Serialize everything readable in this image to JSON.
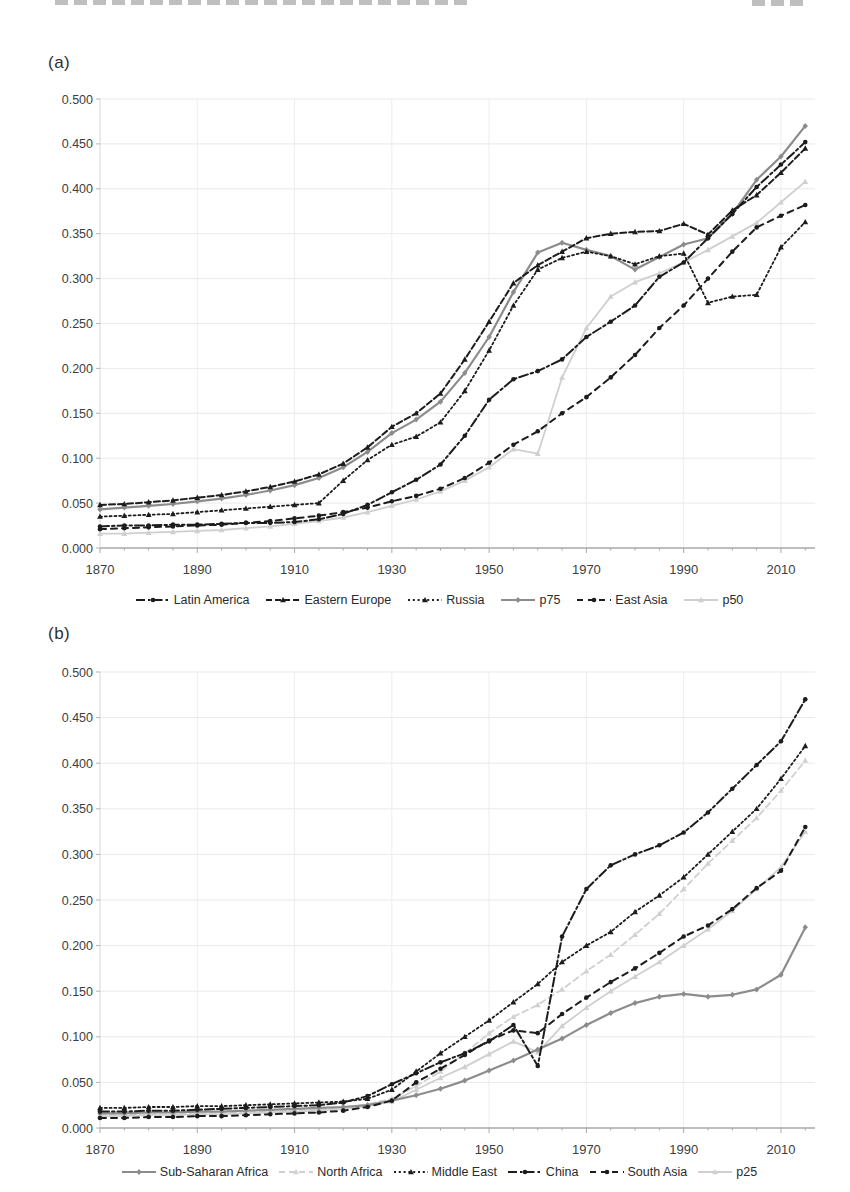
{
  "page": {
    "background": "#ffffff",
    "text_color": "#3d3d3d"
  },
  "chart_data": [
    {
      "id": "a",
      "type": "line",
      "panel_label": "(a)",
      "title": "",
      "xlabel": "",
      "ylabel": "",
      "x": [
        1870,
        1875,
        1880,
        1885,
        1890,
        1895,
        1900,
        1905,
        1910,
        1915,
        1920,
        1925,
        1930,
        1935,
        1940,
        1945,
        1950,
        1955,
        1960,
        1965,
        1970,
        1975,
        1980,
        1985,
        1990,
        1995,
        2000,
        2005,
        2010,
        2015
      ],
      "x_ticks": [
        1870,
        1890,
        1910,
        1930,
        1950,
        1970,
        1990,
        2010
      ],
      "xlim": [
        1870,
        2017
      ],
      "ylim": [
        0,
        0.5
      ],
      "y_tick_step": 0.05,
      "y_tick_decimals": 3,
      "grid": true,
      "legend_position": "bottom",
      "series": [
        {
          "name": "Latin America",
          "color": "#1c1c1c",
          "dash": "9 3 2.5 3",
          "marker": "circle",
          "width": 2,
          "z": 6,
          "values": [
            0.024,
            0.025,
            0.025,
            0.026,
            0.026,
            0.027,
            0.028,
            0.028,
            0.029,
            0.032,
            0.038,
            0.048,
            0.062,
            0.076,
            0.093,
            0.125,
            0.165,
            0.188,
            0.197,
            0.21,
            0.235,
            0.252,
            0.27,
            0.302,
            0.318,
            0.345,
            0.372,
            0.402,
            0.427,
            0.452
          ]
        },
        {
          "name": "Eastern Europe",
          "color": "#1c1c1c",
          "dash": "6 3",
          "marker": "triangle",
          "width": 2,
          "z": 4,
          "values": [
            0.048,
            0.049,
            0.051,
            0.053,
            0.056,
            0.059,
            0.063,
            0.068,
            0.074,
            0.082,
            0.094,
            0.112,
            0.135,
            0.15,
            0.172,
            0.21,
            0.252,
            0.295,
            0.315,
            0.33,
            0.345,
            0.35,
            0.352,
            0.353,
            0.361,
            0.349,
            0.376,
            0.393,
            0.418,
            0.445
          ]
        },
        {
          "name": "Russia",
          "color": "#1c1c1c",
          "dash": "2 2.8",
          "marker": "triangle",
          "width": 1.8,
          "z": 3,
          "values": [
            0.035,
            0.036,
            0.037,
            0.038,
            0.04,
            0.042,
            0.044,
            0.046,
            0.048,
            0.05,
            0.075,
            0.098,
            0.115,
            0.124,
            0.14,
            0.175,
            0.22,
            0.27,
            0.31,
            0.323,
            0.33,
            0.325,
            0.316,
            0.325,
            0.328,
            0.273,
            0.28,
            0.282,
            0.335,
            0.363
          ]
        },
        {
          "name": "p75",
          "color": "#8c8c8c",
          "dash": "",
          "marker": "diamond",
          "width": 2.2,
          "z": 2,
          "values": [
            0.043,
            0.045,
            0.047,
            0.049,
            0.052,
            0.055,
            0.059,
            0.064,
            0.07,
            0.078,
            0.09,
            0.107,
            0.128,
            0.143,
            0.163,
            0.195,
            0.235,
            0.285,
            0.329,
            0.34,
            0.332,
            0.325,
            0.31,
            0.324,
            0.338,
            0.345,
            0.372,
            0.41,
            0.436,
            0.47
          ]
        },
        {
          "name": "East Asia",
          "color": "#1c1c1c",
          "dash": "6 5",
          "marker": "circle",
          "width": 2,
          "z": 5,
          "values": [
            0.021,
            0.022,
            0.023,
            0.024,
            0.025,
            0.026,
            0.028,
            0.03,
            0.033,
            0.036,
            0.04,
            0.045,
            0.052,
            0.058,
            0.066,
            0.078,
            0.095,
            0.115,
            0.13,
            0.15,
            0.168,
            0.19,
            0.215,
            0.245,
            0.27,
            0.3,
            0.33,
            0.357,
            0.37,
            0.382
          ]
        },
        {
          "name": "p50",
          "color": "#cfcfcf",
          "dash": "",
          "marker": "triangle",
          "width": 1.8,
          "z": 1,
          "values": [
            0.016,
            0.016,
            0.017,
            0.018,
            0.019,
            0.02,
            0.022,
            0.024,
            0.027,
            0.03,
            0.034,
            0.04,
            0.047,
            0.054,
            0.063,
            0.075,
            0.09,
            0.11,
            0.105,
            0.19,
            0.245,
            0.28,
            0.296,
            0.306,
            0.318,
            0.332,
            0.347,
            0.362,
            0.385,
            0.408
          ]
        }
      ]
    },
    {
      "id": "b",
      "type": "line",
      "panel_label": "(b)",
      "title": "",
      "xlabel": "",
      "ylabel": "",
      "x": [
        1870,
        1875,
        1880,
        1885,
        1890,
        1895,
        1900,
        1905,
        1910,
        1915,
        1920,
        1925,
        1930,
        1935,
        1940,
        1945,
        1950,
        1955,
        1960,
        1965,
        1970,
        1975,
        1980,
        1985,
        1990,
        1995,
        2000,
        2005,
        2010,
        2015
      ],
      "x_ticks": [
        1870,
        1890,
        1910,
        1930,
        1950,
        1970,
        1990,
        2010
      ],
      "xlim": [
        1870,
        2017
      ],
      "ylim": [
        0,
        0.5
      ],
      "y_tick_step": 0.05,
      "y_tick_decimals": 3,
      "grid": true,
      "legend_position": "bottom",
      "series": [
        {
          "name": "Sub-Saharan Africa",
          "color": "#8c8c8c",
          "dash": "",
          "marker": "diamond",
          "width": 2.2,
          "z": 3,
          "values": [
            0.016,
            0.016,
            0.017,
            0.017,
            0.018,
            0.018,
            0.019,
            0.02,
            0.021,
            0.022,
            0.023,
            0.025,
            0.03,
            0.036,
            0.043,
            0.052,
            0.063,
            0.074,
            0.086,
            0.098,
            0.113,
            0.126,
            0.137,
            0.144,
            0.147,
            0.144,
            0.146,
            0.152,
            0.168,
            0.22
          ]
        },
        {
          "name": "North Africa",
          "color": "#d0d0d0",
          "dash": "6 4",
          "marker": "triangle",
          "width": 1.8,
          "z": 2,
          "values": [
            0.014,
            0.014,
            0.015,
            0.015,
            0.016,
            0.016,
            0.017,
            0.018,
            0.019,
            0.02,
            0.022,
            0.026,
            0.032,
            0.046,
            0.062,
            0.082,
            0.104,
            0.122,
            0.135,
            0.152,
            0.172,
            0.19,
            0.212,
            0.235,
            0.262,
            0.29,
            0.315,
            0.34,
            0.37,
            0.403
          ]
        },
        {
          "name": "Middle East",
          "color": "#1c1c1c",
          "dash": "2 2.8",
          "marker": "triangle",
          "width": 1.8,
          "z": 4,
          "values": [
            0.022,
            0.022,
            0.023,
            0.023,
            0.024,
            0.024,
            0.025,
            0.026,
            0.027,
            0.028,
            0.029,
            0.032,
            0.042,
            0.062,
            0.082,
            0.1,
            0.118,
            0.138,
            0.158,
            0.182,
            0.2,
            0.215,
            0.237,
            0.255,
            0.275,
            0.3,
            0.325,
            0.35,
            0.383,
            0.419
          ]
        },
        {
          "name": "China",
          "color": "#1c1c1c",
          "dash": "9 3 2.5 3",
          "marker": "circle",
          "width": 2,
          "z": 6,
          "values": [
            0.018,
            0.018,
            0.019,
            0.019,
            0.02,
            0.021,
            0.022,
            0.023,
            0.024,
            0.025,
            0.028,
            0.035,
            0.048,
            0.06,
            0.072,
            0.082,
            0.095,
            0.113,
            0.068,
            0.21,
            0.262,
            0.288,
            0.3,
            0.31,
            0.324,
            0.346,
            0.372,
            0.398,
            0.424,
            0.47
          ]
        },
        {
          "name": "South Asia",
          "color": "#1c1c1c",
          "dash": "6 5",
          "marker": "circle",
          "width": 2,
          "z": 5,
          "values": [
            0.011,
            0.011,
            0.012,
            0.012,
            0.013,
            0.013,
            0.014,
            0.015,
            0.016,
            0.017,
            0.019,
            0.023,
            0.03,
            0.05,
            0.065,
            0.08,
            0.096,
            0.107,
            0.104,
            0.125,
            0.143,
            0.16,
            0.175,
            0.192,
            0.21,
            0.222,
            0.24,
            0.263,
            0.282,
            0.33
          ]
        },
        {
          "name": "p25",
          "color": "#cfcfcf",
          "dash": "",
          "marker": "triangle",
          "width": 1.8,
          "z": 1,
          "values": [
            0.013,
            0.013,
            0.014,
            0.014,
            0.015,
            0.015,
            0.016,
            0.017,
            0.018,
            0.019,
            0.021,
            0.024,
            0.029,
            0.042,
            0.055,
            0.067,
            0.081,
            0.095,
            0.083,
            0.112,
            0.132,
            0.15,
            0.166,
            0.182,
            0.2,
            0.218,
            0.238,
            0.262,
            0.286,
            0.325
          ]
        }
      ]
    }
  ]
}
